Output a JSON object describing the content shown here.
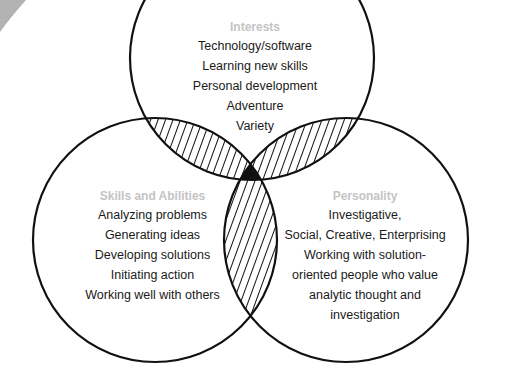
{
  "diagram": {
    "type": "venn",
    "sets": [
      {
        "id": "interests",
        "heading": "Interests",
        "items": [
          "Technology/software",
          "Learning new skills",
          "Personal development",
          "Adventure",
          "Variety"
        ]
      },
      {
        "id": "skills",
        "heading": "Skills and Abilities",
        "items": [
          "Analyzing problems",
          "Generating ideas",
          "Developing solutions",
          "Initiating action",
          "Working well with others"
        ]
      },
      {
        "id": "personality",
        "heading": "Personality",
        "items": [
          "Investigative,",
          "Social, Creative, Enterprising",
          "Working with solution-",
          "oriented people who value",
          "analytic thought and",
          "investigation"
        ]
      }
    ],
    "colors": {
      "heading": "#c4c4c4",
      "text": "#1a1a1a",
      "stroke": "#111111",
      "corner_shape": "#b3b3b3"
    }
  }
}
